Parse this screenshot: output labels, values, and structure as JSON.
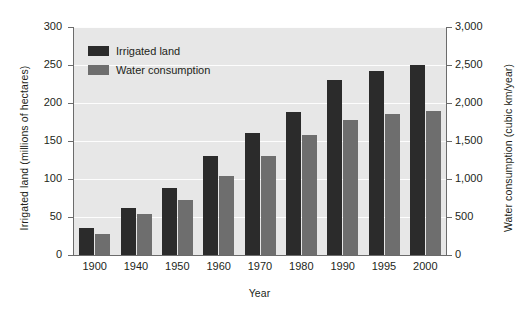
{
  "chart_data": {
    "type": "bar",
    "title": "",
    "categories": [
      "1900",
      "1940",
      "1950",
      "1960",
      "1970",
      "1980",
      "1990",
      "1995",
      "2000"
    ],
    "series": [
      {
        "name": "Irrigated land",
        "axis": "left",
        "units": "millions of hectares",
        "color": "#2b2b2b",
        "values": [
          35,
          62,
          88,
          130,
          160,
          188,
          230,
          242,
          250
        ]
      },
      {
        "name": "Water consumption",
        "axis": "right",
        "units": "cubic km/year",
        "color": "#6e6e6e",
        "values": [
          280,
          540,
          720,
          1040,
          1300,
          1580,
          1780,
          1850,
          1900
        ]
      }
    ],
    "xlabel": "Year",
    "ylabel": "Irrigated land (millions of hectares)",
    "y2label": "Water consumption (cubic km/year)",
    "ylim": [
      0,
      300
    ],
    "y2lim": [
      0,
      3000
    ],
    "yticks": [
      "0",
      "50",
      "100",
      "150",
      "200",
      "250",
      "300"
    ],
    "y2ticks": [
      "0",
      "500",
      "1,000",
      "1,500",
      "2,000",
      "2,500",
      "3,000"
    ],
    "grid": true,
    "legend_position": "top-left",
    "plot_background": "#e7e7e7",
    "gridline_color": "#fdfdfd"
  },
  "legend": {
    "items": [
      {
        "label": "Irrigated land",
        "color": "#2b2b2b"
      },
      {
        "label": "Water consumption",
        "color": "#6e6e6e"
      }
    ]
  }
}
